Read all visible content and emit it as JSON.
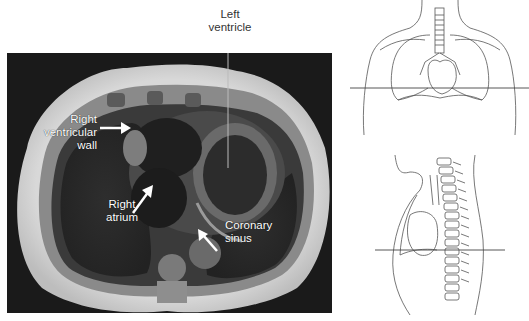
{
  "figure": {
    "mri_panel": {
      "description": "Axial MRI of thorax at level of heart",
      "labels": {
        "left_ventricle": [
          "Left",
          "ventricle"
        ],
        "right_ventricular_wall": [
          "Right",
          "ventricular",
          "wall"
        ],
        "right_atrium": [
          "Right",
          "atrium"
        ],
        "coronary_sinus": [
          "Coronary",
          "sinus"
        ]
      }
    },
    "orientation_diagrams": [
      {
        "view": "frontal",
        "description": "Anterior torso outline with lungs, trachea, heart; horizontal plane line marks section level"
      },
      {
        "view": "sagittal",
        "description": "Lateral torso outline with spine and heart; horizontal plane line marks section level"
      }
    ]
  }
}
